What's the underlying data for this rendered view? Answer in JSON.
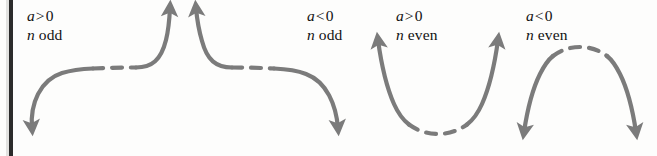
{
  "figure": {
    "curve_color": "#7b7b7b",
    "dash_color": "#7b7b7b",
    "text_color": "#121212",
    "background_color": "#fdfdfc",
    "gutter_bar_color": "#2b2b2b",
    "stroke_width": 4.2,
    "dash_pattern": "10 9"
  },
  "cases": [
    {
      "id": "a-positive-n-odd",
      "coefficient_label": "a > 0",
      "coefficient_var": "a",
      "coefficient_relation": ">",
      "coefficient_value": "0",
      "degree_label": "n odd",
      "degree_var": "n",
      "degree_parity": "odd",
      "shape": "rising-cubic",
      "left_end": "down",
      "right_end": "up",
      "left_arrow": "down-left",
      "right_arrow": "up"
    },
    {
      "id": "a-negative-n-odd",
      "coefficient_label": "a < 0",
      "coefficient_var": "a",
      "coefficient_relation": "<",
      "coefficient_value": "0",
      "degree_label": "n odd",
      "degree_var": "n",
      "degree_parity": "odd",
      "shape": "falling-cubic",
      "left_end": "up",
      "right_end": "down",
      "left_arrow": "up",
      "right_arrow": "down-right"
    },
    {
      "id": "a-positive-n-even",
      "coefficient_label": "a > 0",
      "coefficient_var": "a",
      "coefficient_relation": ">",
      "coefficient_value": "0",
      "degree_label": "n even",
      "degree_var": "n",
      "degree_parity": "even",
      "shape": "upward-parabola",
      "left_end": "up",
      "right_end": "up",
      "left_arrow": "up",
      "right_arrow": "up"
    },
    {
      "id": "a-negative-n-even",
      "coefficient_label": "a < 0",
      "coefficient_var": "a",
      "coefficient_relation": "<",
      "coefficient_value": "0",
      "degree_label": "n even",
      "degree_var": "n",
      "degree_parity": "even",
      "shape": "downward-parabola",
      "left_end": "down",
      "right_end": "down",
      "left_arrow": "down",
      "right_arrow": "down"
    }
  ]
}
